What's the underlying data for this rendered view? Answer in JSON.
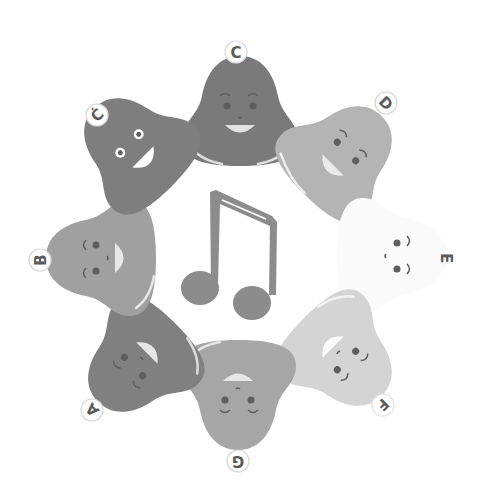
{
  "illustration": {
    "subject": "Ring of singing bell characters around a musical note",
    "center_icon": "double-eighth-note-icon",
    "colors": {
      "background": "#ffffff",
      "note": "#8c8c8c",
      "eye": "#5e5e5e",
      "mouth": "#e2e2e2",
      "label_ring": "#d8d8d8",
      "label_text": "#5a5a5a"
    },
    "bells": [
      {
        "id": "c",
        "label": "C",
        "cx": 240,
        "cy": 118,
        "rotate": 0,
        "color": "#7a7a7a",
        "label_x": 236,
        "label_y": 52
      },
      {
        "id": "d",
        "label": "D",
        "cx": 338,
        "cy": 160,
        "rotate": 45,
        "color": "#b4b4b4",
        "label_x": 386,
        "label_y": 103
      },
      {
        "id": "e",
        "label": "E",
        "cx": 385,
        "cy": 256,
        "rotate": 90,
        "color": "#fbfbfb",
        "label_x": 446,
        "label_y": 258
      },
      {
        "id": "f",
        "label": "F",
        "cx": 338,
        "cy": 352,
        "rotate": 135,
        "color": "#d4d4d4",
        "label_x": 383,
        "label_y": 405
      },
      {
        "id": "g",
        "label": "G",
        "cx": 238,
        "cy": 388,
        "rotate": 180,
        "color": "#a6a6a6",
        "label_x": 238,
        "label_y": 461
      },
      {
        "id": "a",
        "label": "A",
        "cx": 142,
        "cy": 358,
        "rotate": -135,
        "color": "#808080",
        "label_x": 92,
        "label_y": 410
      },
      {
        "id": "b",
        "label": "B",
        "cx": 108,
        "cy": 258,
        "rotate": -90,
        "color": "#a0a0a0",
        "label_x": 40,
        "label_y": 260
      },
      {
        "id": "c2",
        "label": "Ċ",
        "cx": 138,
        "cy": 152,
        "rotate": -45,
        "color": "#7e7e7e",
        "label_x": 97,
        "label_y": 115
      }
    ]
  }
}
